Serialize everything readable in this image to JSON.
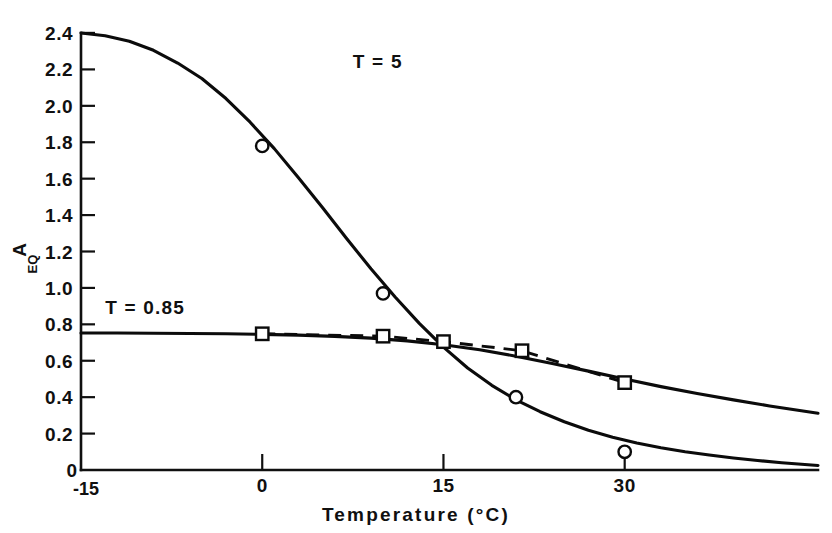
{
  "chart_data": {
    "type": "line",
    "title": "",
    "xlabel": "Temperature  (°C)",
    "ylabel": "A",
    "ylabel_subscript": "EQ",
    "xlim": [
      -15,
      46
    ],
    "ylim": [
      0,
      2.4
    ],
    "grid": false,
    "legend_position": "inline-annotations",
    "x_ticks": [
      {
        "value": 0,
        "label": "0"
      },
      {
        "value": 15,
        "label": "15"
      },
      {
        "value": 30,
        "label": "30"
      }
    ],
    "x_axis_start_label": "-15",
    "y_origin_label": "0",
    "y_ticks": [
      {
        "value": 0.2,
        "label": "0.2"
      },
      {
        "value": 0.4,
        "label": "0.4"
      },
      {
        "value": 0.6,
        "label": "0.6"
      },
      {
        "value": 0.8,
        "label": "0.8"
      },
      {
        "value": 1.0,
        "label": "1.0"
      },
      {
        "value": 1.2,
        "label": "1.2"
      },
      {
        "value": 1.4,
        "label": "1.4"
      },
      {
        "value": 1.6,
        "label": "1.6"
      },
      {
        "value": 1.8,
        "label": "1.8"
      },
      {
        "value": 2.0,
        "label": "2.0"
      },
      {
        "value": 2.2,
        "label": "2.2"
      },
      {
        "value": 2.4,
        "label": "2.4"
      }
    ],
    "annotations": [
      {
        "text": "T = 5",
        "x": 7.5,
        "y": 2.21,
        "name": "annotation-t5"
      },
      {
        "text": "T = 0.85",
        "x": -13.0,
        "y": 0.855,
        "name": "annotation-t085"
      }
    ],
    "series": [
      {
        "name": "T = 5 model curve",
        "style": "solid",
        "marker": "none",
        "color": "#0b0b0b",
        "x": [
          -15,
          -13,
          -11,
          -9,
          -7,
          -5,
          -3,
          -1,
          1,
          3,
          5,
          7,
          9,
          11,
          13,
          15,
          17,
          19,
          21,
          23,
          25,
          27,
          29,
          31,
          33,
          35,
          37,
          39,
          41,
          43,
          46
        ],
        "y": [
          2.4,
          2.385,
          2.355,
          2.305,
          2.235,
          2.15,
          2.04,
          1.91,
          1.765,
          1.605,
          1.44,
          1.27,
          1.105,
          0.95,
          0.805,
          0.675,
          0.56,
          0.465,
          0.385,
          0.32,
          0.265,
          0.218,
          0.18,
          0.148,
          0.122,
          0.1,
          0.082,
          0.066,
          0.052,
          0.04,
          0.025
        ]
      },
      {
        "name": "T = 0.85 model curve",
        "style": "solid",
        "marker": "none",
        "color": "#0b0b0b",
        "x": [
          -15,
          -12,
          -9,
          -6,
          -3,
          0,
          3,
          6,
          9,
          12,
          15,
          18,
          21,
          24,
          27,
          30,
          33,
          36,
          39,
          42,
          46
        ],
        "y": [
          0.752,
          0.752,
          0.751,
          0.75,
          0.748,
          0.745,
          0.741,
          0.734,
          0.724,
          0.709,
          0.688,
          0.66,
          0.625,
          0.585,
          0.543,
          0.5,
          0.458,
          0.42,
          0.385,
          0.352,
          0.312
        ]
      },
      {
        "name": "Experimental series A (circles)",
        "style": "none",
        "marker": "circle",
        "color": "#0b0b0b",
        "x": [
          0,
          10,
          21,
          30
        ],
        "y": [
          1.78,
          0.97,
          0.4,
          0.1
        ]
      },
      {
        "name": "Experimental series B (squares, dashed)",
        "style": "dashed",
        "marker": "square",
        "color": "#0b0b0b",
        "x": [
          0,
          10,
          15,
          21.5,
          30
        ],
        "y": [
          0.748,
          0.735,
          0.705,
          0.655,
          0.48
        ]
      }
    ]
  },
  "figure": {
    "background_color": "#ffffff",
    "ink_color": "#0b0b0b"
  }
}
